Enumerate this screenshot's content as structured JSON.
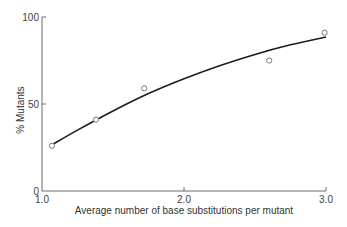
{
  "chart_data": {
    "type": "scatter",
    "title": "",
    "xlabel": "Average number of base substitutions per mutant",
    "ylabel": "% Mutants",
    "xlim": [
      1.0,
      3.0
    ],
    "ylim": [
      0,
      100
    ],
    "x_ticks": [
      1.0,
      2.0,
      3.0
    ],
    "x_tick_labels": [
      "1.0",
      "2.0",
      "3.0"
    ],
    "y_ticks": [
      0,
      50,
      100
    ],
    "y_tick_labels": [
      "0",
      "50",
      "100"
    ],
    "grid": false,
    "legend": "none",
    "series": [
      {
        "name": "observed",
        "marker": "open-circle",
        "x": [
          1.07,
          1.38,
          1.72,
          2.6,
          2.99
        ],
        "y": [
          26,
          41,
          59,
          75,
          91
        ]
      },
      {
        "name": "fitted-curve",
        "style": "line",
        "x": [
          1.08,
          1.25,
          1.5,
          1.75,
          2.0,
          2.25,
          2.5,
          2.75,
          3.0
        ],
        "y": [
          27,
          35,
          46,
          56,
          64.5,
          72,
          78.5,
          84,
          88.5
        ]
      }
    ]
  }
}
